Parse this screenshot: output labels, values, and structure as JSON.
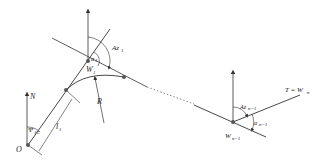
{
  "diagram": {
    "type": "well-trajectory-geometry",
    "colors": {
      "line": "#333333",
      "node": "#555555",
      "background": "#ffffff"
    },
    "labels": {
      "origin": "O",
      "north": "N",
      "psi": "Ψ",
      "psi_sub": "1C",
      "l": "l",
      "l_sub": "1",
      "w1": "W",
      "w1_sub": "1",
      "alpha1": "α",
      "alpha1_sub": "1",
      "az1": "Az",
      "az1_sub": "1",
      "r": "R",
      "wn1": "W",
      "wn1_sub": "n−1",
      "azn1": "Az",
      "azn1_sub": "n−1",
      "alphan1": "α",
      "alphan1_sub": "n−1",
      "target": "T = W",
      "target_sub": "n"
    },
    "nodes": [
      {
        "name": "O",
        "x": 28,
        "y": 145
      },
      {
        "name": "arc-start",
        "x": 66,
        "y": 90
      },
      {
        "name": "W1",
        "x": 88,
        "y": 61
      },
      {
        "name": "arc-end",
        "x": 124,
        "y": 77
      },
      {
        "name": "Wn-1",
        "x": 233,
        "y": 122
      }
    ]
  }
}
